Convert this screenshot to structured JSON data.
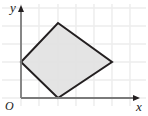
{
  "figure": {
    "name": "coordinate-plane-quadrilateral",
    "width": 148,
    "height": 116,
    "background_color": "#ffffff"
  },
  "axes": {
    "x_label": "x",
    "y_label": "y",
    "origin_label": "O",
    "axis_color": "#7a7a7a",
    "x_axis": {
      "y_px": 98,
      "x_start_px": 21,
      "x_end_px": 138,
      "arrow": "right"
    },
    "y_axis": {
      "x_px": 21,
      "y_start_px": 98,
      "y_end_px": 8,
      "arrow": "up"
    }
  },
  "grid": {
    "visible": true,
    "color": "#ececec",
    "spacing_px": 18,
    "vertical_lines_px": [
      21,
      39,
      58,
      76,
      94,
      112,
      130
    ],
    "horizontal_lines_px": [
      8,
      26,
      44,
      62,
      80,
      98
    ]
  },
  "chart_data": {
    "type": "scatter",
    "title": "",
    "xlabel": "x",
    "ylabel": "y",
    "grid": true,
    "legend": null,
    "shape": {
      "kind": "quadrilateral",
      "fill_color": "#e2e2e2",
      "stroke_color": "#231f20",
      "stroke_width_px": 2,
      "vertices_px": [
        {
          "name": "top",
          "x": 58,
          "y": 23
        },
        {
          "name": "right",
          "x": 112,
          "y": 62
        },
        {
          "name": "bottom",
          "x": 58,
          "y": 98
        },
        {
          "name": "left",
          "x": 21,
          "y": 62
        }
      ],
      "vertices_grid_units": [
        {
          "name": "top",
          "x": 2,
          "y": 4
        },
        {
          "name": "right",
          "x": 5,
          "y": 2
        },
        {
          "name": "bottom",
          "x": 2,
          "y": 0
        },
        {
          "name": "left",
          "x": 0,
          "y": 2
        }
      ]
    }
  }
}
